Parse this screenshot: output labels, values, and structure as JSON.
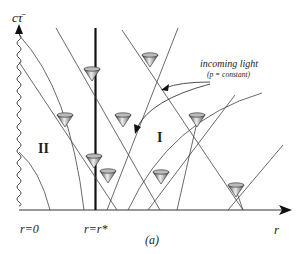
{
  "figure": {
    "caption": "(a)",
    "axes": {
      "vertical_label": "cτ̄",
      "horizontal_label": "r"
    },
    "tick_labels": {
      "origin": "r=0",
      "star": "r=r*"
    },
    "regions": {
      "region_one": "I",
      "region_two": "II"
    },
    "annotation": {
      "title": "incoming light",
      "subtitle": "(p = constant)"
    }
  }
}
